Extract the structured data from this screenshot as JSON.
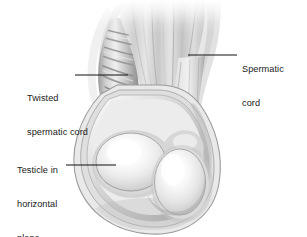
{
  "figure": {
    "background_color": "#ffffff",
    "width": 307,
    "height": 237,
    "style": "grayscale medical line-and-wash illustration"
  },
  "labels": {
    "spermatic_cord": {
      "line1": "Spermatic",
      "line2": "cord",
      "full_text": "Spermatic cord",
      "position": "right",
      "leader_line": {
        "x1": 188,
        "y1": 55,
        "x2": 237,
        "y2": 55
      }
    },
    "twisted_spermatic_cord": {
      "line1": "Twisted",
      "line2": "spermatic cord",
      "full_text": "Twisted spermatic cord",
      "position": "left-upper",
      "leader_line": {
        "x1": 75,
        "y1": 75,
        "x2": 128,
        "y2": 75
      }
    },
    "testicle_horizontal": {
      "line1": "Testicle in",
      "line2": "horizontal",
      "line3": "plane",
      "full_text": "Testicle in horizontal plane",
      "position": "left-lower",
      "leader_line": {
        "x1": 66,
        "y1": 165,
        "x2": 116,
        "y2": 165
      }
    }
  },
  "colors": {
    "text": "#1a1a1a",
    "leader_line": "#111111",
    "background": "#ffffff",
    "tissue_light": "#f2f2f2",
    "tissue_mid": "#c9c9c9",
    "tissue_dark": "#8f8f8f",
    "tissue_shadow": "#6e6e6e",
    "highlight": "#fdfdfd"
  },
  "structures": [
    {
      "name": "spermatic-cord-fan",
      "description": "Vertical striated cord fanning out at top"
    },
    {
      "name": "twisted-spermatic-cord",
      "description": "Helically twisted cord with spiral ridges on left"
    },
    {
      "name": "scrotal-wall-layers",
      "description": "Concentric outer scrotal wall layers"
    },
    {
      "name": "testicle-horizontal",
      "description": "Large round testicle lying in horizontal plane (left)"
    },
    {
      "name": "testicle-normal",
      "description": "Vertical oval testicle (right)"
    }
  ]
}
